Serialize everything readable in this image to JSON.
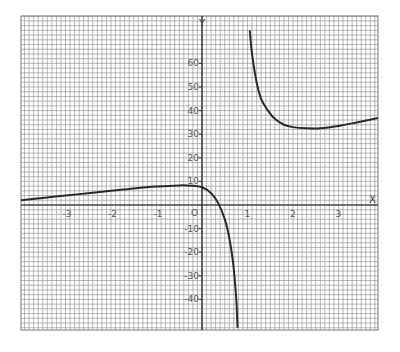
{
  "chart_data": {
    "type": "line",
    "title": "",
    "xlabel": "X",
    "ylabel": "Y",
    "xlim": [
      -4.0,
      3.9
    ],
    "ylim": [
      -50,
      80
    ],
    "grid": true,
    "legend": null,
    "x_ticks": [
      -3,
      -2,
      -1,
      0,
      1,
      2,
      3
    ],
    "x_tick_labels": [
      "-3",
      "-2",
      "-1",
      "0",
      "1",
      "2",
      "3"
    ],
    "y_ticks": [
      60,
      50,
      40,
      30,
      20,
      10,
      -10,
      -20,
      -30,
      -40
    ],
    "y_tick_labels": [
      "60",
      "50",
      "40",
      "30",
      "20",
      "10",
      "-10",
      "-20",
      "-30",
      "-40"
    ],
    "origin_label": "O",
    "series": [
      {
        "name": "left-branch",
        "x": [
          -3.98,
          -3.5,
          -3.0,
          -2.5,
          -2.0,
          -1.5,
          -1.0,
          -0.5,
          -0.25,
          0.0,
          0.2,
          0.35,
          0.5,
          0.6,
          0.68,
          0.73,
          0.76,
          0.78
        ],
        "y": [
          2,
          3,
          4,
          5,
          6,
          7,
          7.8,
          8.3,
          8.2,
          7.5,
          5,
          1,
          -6,
          -14,
          -24,
          -34,
          -42,
          -52
        ]
      },
      {
        "name": "right-branch",
        "x": [
          1.05,
          1.1,
          1.2,
          1.3,
          1.45,
          1.6,
          1.8,
          2.0,
          2.3,
          2.6,
          3.0,
          3.4,
          3.9
        ],
        "y": [
          74,
          64,
          52,
          45,
          40,
          36.5,
          34,
          33,
          32.5,
          32.5,
          33.5,
          35,
          37
        ]
      }
    ]
  },
  "axes": {
    "x_name": "X",
    "y_name": "Y"
  }
}
